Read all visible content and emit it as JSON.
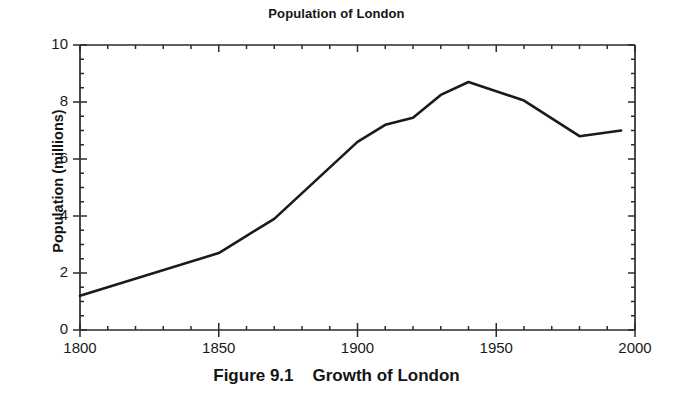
{
  "figure": {
    "caption": "Figure 9.1    Growth of London"
  },
  "chart_data": {
    "type": "line",
    "title": "Population of London",
    "xlabel": "",
    "ylabel": "Population (millions)",
    "xlim": [
      1800,
      2000
    ],
    "ylim": [
      0,
      10
    ],
    "grid": false,
    "legend": null,
    "x_ticks": [
      1800,
      1850,
      1900,
      1950,
      2000
    ],
    "x_tick_labels": [
      "1800",
      "1850",
      "1900",
      "1950",
      "2000"
    ],
    "x_minor_tick_interval": 10,
    "y_ticks": [
      0,
      2,
      4,
      6,
      8,
      10
    ],
    "y_tick_labels": [
      "0",
      "2",
      "4",
      "6",
      "8",
      "10"
    ],
    "y_minor_tick_interval": 0.5,
    "line_color": "#1a1a1a",
    "line_width": 2.6,
    "x": [
      1800,
      1850,
      1870,
      1900,
      1910,
      1920,
      1930,
      1940,
      1960,
      1980,
      1995
    ],
    "values": [
      1.2,
      2.7,
      3.9,
      6.6,
      7.2,
      7.45,
      8.25,
      8.7,
      8.05,
      6.8,
      7.0
    ],
    "series": [
      {
        "name": "Population of London",
        "points": [
          {
            "x": 1800,
            "y": 1.2
          },
          {
            "x": 1850,
            "y": 2.7
          },
          {
            "x": 1870,
            "y": 3.9
          },
          {
            "x": 1900,
            "y": 6.6
          },
          {
            "x": 1910,
            "y": 7.2
          },
          {
            "x": 1920,
            "y": 7.45
          },
          {
            "x": 1930,
            "y": 8.25
          },
          {
            "x": 1940,
            "y": 8.7
          },
          {
            "x": 1960,
            "y": 8.05
          },
          {
            "x": 1980,
            "y": 6.8
          },
          {
            "x": 1995,
            "y": 7.0
          }
        ]
      }
    ]
  }
}
